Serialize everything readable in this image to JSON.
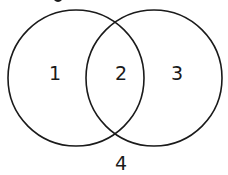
{
  "diagram": {
    "type": "venn",
    "stroke_color": "#1a1a1a",
    "background": "#ffffff",
    "circles": [
      {
        "name": "left",
        "cx": 76,
        "cy": 78,
        "r": 68
      },
      {
        "name": "right",
        "cx": 154,
        "cy": 78,
        "r": 68
      }
    ],
    "regions": [
      {
        "label": "1",
        "x": 55,
        "y": 80
      },
      {
        "label": "2",
        "x": 121,
        "y": 80
      },
      {
        "label": "3",
        "x": 177,
        "y": 80
      },
      {
        "label": "4",
        "x": 121,
        "y": 170
      }
    ]
  }
}
